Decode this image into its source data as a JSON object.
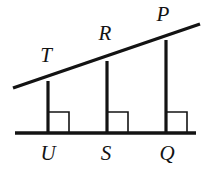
{
  "figure": {
    "kind": "geometry-diagram",
    "width": 207,
    "height": 169,
    "background": "#ffffff",
    "stroke_color": "#131313",
    "label_color": "#131313",
    "thick_stroke_width": 3.2,
    "thin_stroke_width": 1.6,
    "labels": {
      "T": "T",
      "R": "R",
      "P": "P",
      "U": "U",
      "S": "S",
      "Q": "Q"
    },
    "label_positions": {
      "T": {
        "x": 46,
        "y": 55,
        "size": 21
      },
      "R": {
        "x": 105,
        "y": 33,
        "size": 21
      },
      "P": {
        "x": 163,
        "y": 14,
        "size": 21
      },
      "U": {
        "x": 48,
        "y": 153,
        "size": 21
      },
      "S": {
        "x": 106,
        "y": 153,
        "size": 21
      },
      "Q": {
        "x": 167,
        "y": 153,
        "size": 21
      }
    },
    "baseline": {
      "x1": 15,
      "y1": 133,
      "x2": 196,
      "y2": 133
    },
    "transversal": {
      "x1": 13,
      "y1": 88,
      "x2": 200,
      "y2": 24
    },
    "verticals": [
      {
        "name": "TU",
        "x": 48,
        "y_top": 81,
        "y_bottom": 133
      },
      {
        "name": "RS",
        "x": 107,
        "y_top": 61,
        "y_bottom": 133
      },
      {
        "name": "PQ",
        "x": 166,
        "y_top": 40,
        "y_bottom": 133
      }
    ],
    "right_angle_marks": [
      {
        "at": "U",
        "x": 48,
        "y": 133,
        "size": 21,
        "side": "right"
      },
      {
        "at": "S",
        "x": 107,
        "y": 133,
        "size": 21,
        "side": "right"
      },
      {
        "at": "Q",
        "x": 166,
        "y": 133,
        "size": 21,
        "side": "right"
      }
    ]
  }
}
